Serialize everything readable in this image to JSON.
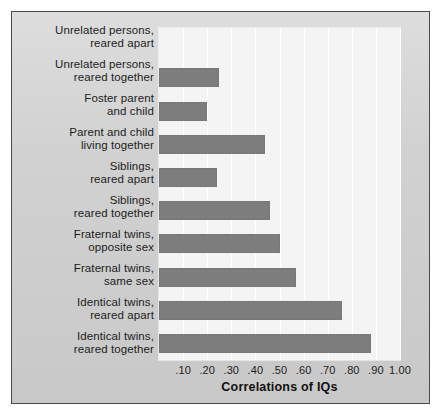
{
  "chart_data": {
    "type": "bar",
    "orientation": "horizontal",
    "title": "",
    "xlabel": "Correlations of IQs",
    "ylabel": "",
    "xlim": [
      0.0,
      1.0
    ],
    "grid": true,
    "legend": false,
    "xticks": [
      ".10",
      ".20",
      ".30",
      ".40",
      ".50",
      ".60",
      ".70",
      ".80",
      ".90",
      "1.00"
    ],
    "xtick_values": [
      0.1,
      0.2,
      0.3,
      0.4,
      0.5,
      0.6,
      0.7,
      0.8,
      0.9,
      1.0
    ],
    "categories": [
      "Unrelated persons,\nreared apart",
      "Unrelated persons,\nreared together",
      "Foster parent\nand child",
      "Parent and child\nliving together",
      "Siblings,\nreared apart",
      "Siblings,\nreared together",
      "Fraternal twins,\nopposite sex",
      "Fraternal twins,\nsame sex",
      "Identical twins,\nreared apart",
      "Identical twins,\nreared together"
    ],
    "values": [
      0.0,
      0.25,
      0.2,
      0.44,
      0.24,
      0.46,
      0.5,
      0.57,
      0.76,
      0.88
    ],
    "bars": [
      {
        "line1": "Unrelated persons,",
        "line2": "reared apart",
        "value": 0.0
      },
      {
        "line1": "Unrelated persons,",
        "line2": "reared together",
        "value": 0.25
      },
      {
        "line1": "Foster parent",
        "line2": "and child",
        "value": 0.2
      },
      {
        "line1": "Parent and child",
        "line2": "living together",
        "value": 0.44
      },
      {
        "line1": "Siblings,",
        "line2": "reared apart",
        "value": 0.24
      },
      {
        "line1": "Siblings,",
        "line2": "reared together",
        "value": 0.46
      },
      {
        "line1": "Fraternal twins,",
        "line2": "opposite sex",
        "value": 0.5
      },
      {
        "line1": "Fraternal twins,",
        "line2": "same sex",
        "value": 0.57
      },
      {
        "line1": "Identical twins,",
        "line2": "reared apart",
        "value": 0.76
      },
      {
        "line1": "Identical twins,",
        "line2": "reared together",
        "value": 0.88
      }
    ],
    "colors": {
      "bar": "#7d7d7d",
      "plot_background": "#f4f4f4",
      "panel_background": "#cfcfcf",
      "gridline": "#ffffff",
      "text": "#1c1c1c",
      "border": "#4a4a4a"
    }
  }
}
